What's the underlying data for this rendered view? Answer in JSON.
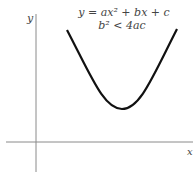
{
  "diagram": {
    "axes": {
      "x_label": "x",
      "y_label": "y",
      "color": "#888888"
    },
    "curve": {
      "type": "parabola",
      "opens": "up",
      "color": "#111111"
    },
    "equation": {
      "line1": "y = ax² + bx + c",
      "line2": "b² < 4ac"
    }
  }
}
